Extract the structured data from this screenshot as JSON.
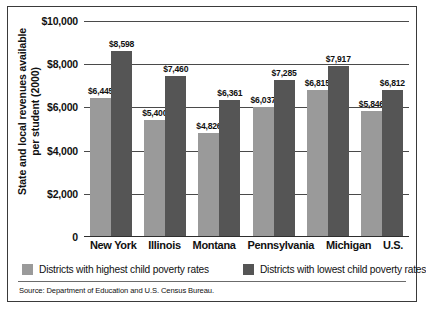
{
  "chart_data": {
    "type": "bar",
    "title": "",
    "xlabel": "",
    "ylabel": "State and local revenues available per student (2000)",
    "categories": [
      "New York",
      "Illinois",
      "Montana",
      "Pennsylvania",
      "Michigan",
      "U.S."
    ],
    "series": [
      {
        "name": "Districts with highest child poverty rates",
        "color": "#9a9a9a",
        "values": [
          6445,
          5400,
          4826,
          6037,
          6815,
          5846
        ],
        "labels": [
          "$6,445",
          "$5,400",
          "$4,826",
          "$6,037",
          "$6,815",
          "$5,846"
        ]
      },
      {
        "name": "Districts with lowest child poverty rates",
        "color": "#555555",
        "values": [
          8598,
          7460,
          6361,
          7285,
          7917,
          6812
        ],
        "labels": [
          "$8,598",
          "$7,460",
          "$6,361",
          "$7,285",
          "$7,917",
          "$6,812"
        ]
      }
    ],
    "ylim": [
      0,
      10000
    ],
    "yticks": [
      10000,
      8000,
      6000,
      4000,
      2000,
      0
    ],
    "ytick_labels": [
      "$10,000",
      "$8,000",
      "$6,000",
      "$4,000",
      "$2,000",
      "0"
    ],
    "grid": true,
    "legend_position": "bottom"
  },
  "legend": {
    "items": [
      {
        "label": "Districts with highest child poverty rates",
        "color": "#9a9a9a"
      },
      {
        "label": "Districts with lowest child poverty rates",
        "color": "#555555"
      }
    ]
  },
  "source": {
    "text": "Source: Department of Education and U.S. Census Bureau."
  }
}
